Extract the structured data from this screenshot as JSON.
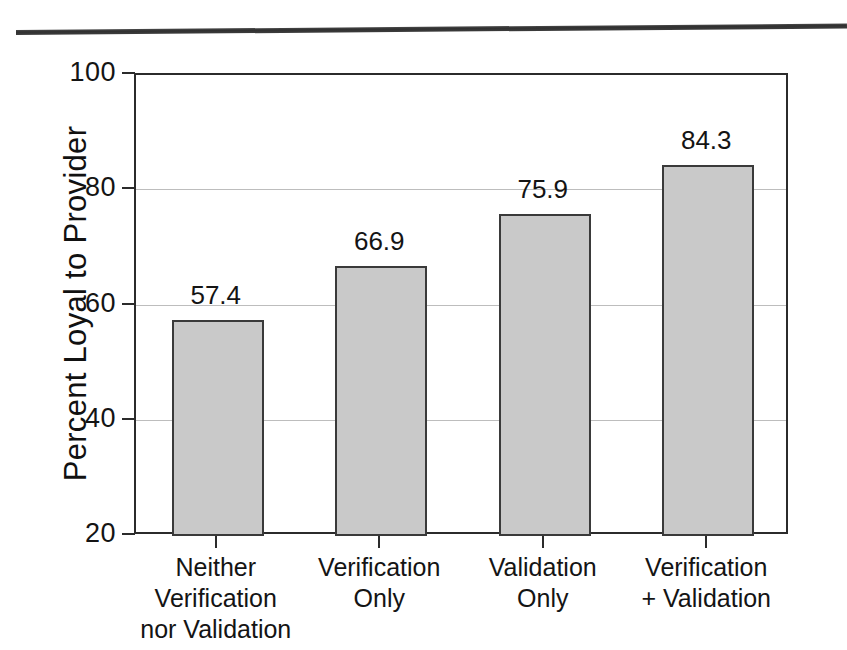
{
  "figure": {
    "top_rule": "horizontal-rule"
  },
  "chart_data": {
    "type": "bar",
    "title": "",
    "xlabel": "",
    "ylabel": "Percent Loyal to Provider",
    "categories": [
      "Neither\nVerification\nnor Validation",
      "Verification\nOnly",
      "Validation\nOnly",
      "Verification\n+ Validation"
    ],
    "category_lines": [
      [
        "Neither",
        "Verification",
        "nor Validation"
      ],
      [
        "Verification",
        "Only"
      ],
      [
        "Validation",
        "Only"
      ],
      [
        "Verification",
        "+ Validation"
      ]
    ],
    "values": [
      57.4,
      66.9,
      75.9,
      84.3
    ],
    "value_labels": [
      "57.4",
      "66.9",
      "75.9",
      "84.3"
    ],
    "ylim": [
      20,
      100
    ],
    "yticks": [
      100,
      80,
      60,
      40,
      20
    ],
    "ytick_labels": [
      "100",
      "80",
      "60",
      "40",
      "20"
    ],
    "grid": true,
    "legend": null,
    "bar_fill_color": "#c9c9c9",
    "bar_edge_color": "#3a3a3a",
    "axis_color": "#2b2b2b",
    "gridline_color": "#bdbdbd"
  }
}
